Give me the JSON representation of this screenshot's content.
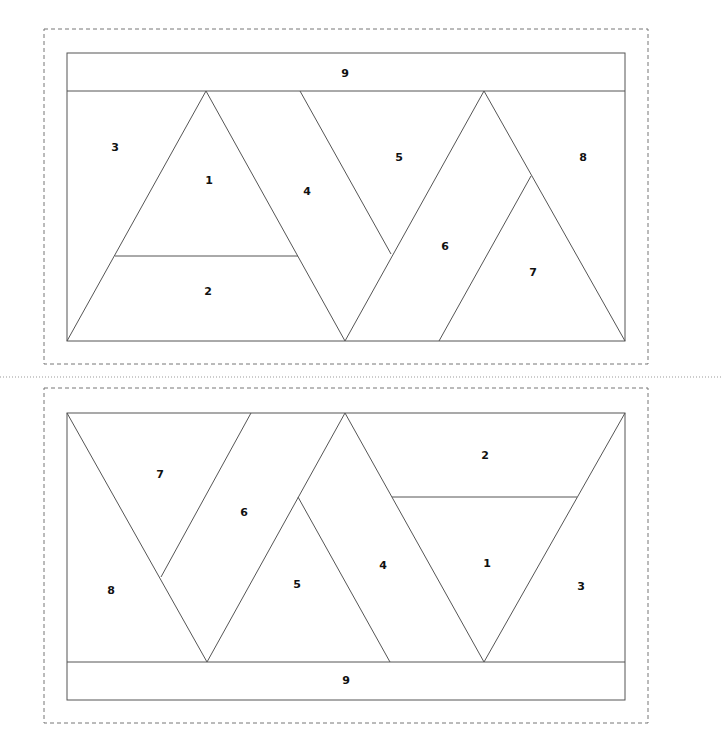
{
  "colors": {
    "line": "#555555",
    "dash": "#777777",
    "background": "#ffffff",
    "text": "#111111"
  },
  "blocks": [
    {
      "name": "top-block",
      "labels": [
        {
          "text": "9",
          "x": 345,
          "y": 74
        },
        {
          "text": "3",
          "x": 115,
          "y": 148
        },
        {
          "text": "1",
          "x": 209,
          "y": 181
        },
        {
          "text": "4",
          "x": 307,
          "y": 192
        },
        {
          "text": "2",
          "x": 208,
          "y": 292
        },
        {
          "text": "5",
          "x": 399,
          "y": 158
        },
        {
          "text": "8",
          "x": 583,
          "y": 158
        },
        {
          "text": "6",
          "x": 445,
          "y": 247
        },
        {
          "text": "7",
          "x": 533,
          "y": 273
        }
      ]
    },
    {
      "name": "bottom-block",
      "labels": [
        {
          "text": "7",
          "x": 160,
          "y": 475
        },
        {
          "text": "6",
          "x": 244,
          "y": 513
        },
        {
          "text": "2",
          "x": 485,
          "y": 456
        },
        {
          "text": "8",
          "x": 111,
          "y": 591
        },
        {
          "text": "5",
          "x": 297,
          "y": 585
        },
        {
          "text": "4",
          "x": 383,
          "y": 566
        },
        {
          "text": "1",
          "x": 487,
          "y": 564
        },
        {
          "text": "3",
          "x": 581,
          "y": 587
        },
        {
          "text": "9",
          "x": 346,
          "y": 681
        }
      ]
    }
  ]
}
